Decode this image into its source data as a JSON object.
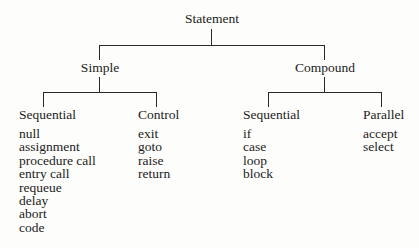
{
  "root": {
    "label": "Statement"
  },
  "branches": [
    {
      "label": "Simple",
      "groups": [
        {
          "label": "Sequential",
          "items": [
            "null",
            "assignment",
            "procedure call",
            "entry call",
            "requeue",
            "delay",
            "abort",
            "code"
          ]
        },
        {
          "label": "Control",
          "items": [
            "exit",
            "goto",
            "raise",
            "return"
          ]
        }
      ]
    },
    {
      "label": "Compound",
      "groups": [
        {
          "label": "Sequential",
          "items": [
            "if",
            "case",
            "loop",
            "block"
          ]
        },
        {
          "label": "Parallel",
          "items": [
            "accept",
            "select"
          ]
        }
      ]
    }
  ]
}
